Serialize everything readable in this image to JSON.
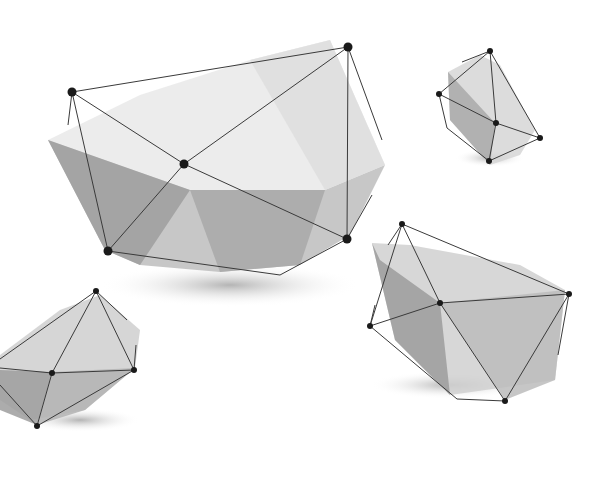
{
  "scene": {
    "width": 615,
    "height": 489,
    "background": "#ffffff",
    "line_color": "#3a3a3a",
    "node_color": "#1a1a1a",
    "shapes": [
      {
        "name": "large-polyhedron",
        "shadow": {
          "cx": 230,
          "cy": 285,
          "rx": 130,
          "ry": 22
        },
        "faces": [
          {
            "points": "48,140 140,95 250,60 330,40 385,165 325,190 190,190",
            "fill": "#e9e9e9"
          },
          {
            "points": "48,140 190,190 325,190 385,165 350,235 300,265 220,272 140,265 105,250",
            "fill": "#bdbdbd"
          },
          {
            "points": "190,190 325,190 300,265 220,272",
            "fill": "#a8a8a8"
          },
          {
            "points": "48,140 105,250 140,265 190,190",
            "fill": "#9d9d9d"
          },
          {
            "points": "250,60 330,40 385,165 325,190",
            "fill": "#dedede"
          }
        ],
        "nodes": [
          [
            72,
            92
          ],
          [
            348,
            47
          ],
          [
            184,
            164
          ],
          [
            108,
            251
          ],
          [
            347,
            239
          ]
        ],
        "edges": [
          [
            72,
            92,
            348,
            47
          ],
          [
            72,
            92,
            184,
            164
          ],
          [
            184,
            164,
            347,
            239
          ],
          [
            348,
            47,
            184,
            164
          ],
          [
            184,
            164,
            108,
            251
          ],
          [
            72,
            92,
            108,
            251
          ],
          [
            348,
            47,
            347,
            239
          ],
          [
            108,
            251,
            280,
            275
          ],
          [
            280,
            275,
            347,
            239
          ],
          [
            348,
            47,
            382,
            140
          ],
          [
            72,
            92,
            68,
            125
          ],
          [
            347,
            239,
            372,
            195
          ]
        ]
      },
      {
        "name": "top-right-polyhedron",
        "shadow": {
          "cx": 490,
          "cy": 158,
          "rx": 35,
          "ry": 9
        },
        "faces": [
          {
            "points": "448,72 480,55 500,65 535,130 520,155 490,165 450,120",
            "fill": "#d6d6d6"
          },
          {
            "points": "448,72 450,120 490,165 495,123",
            "fill": "#a9a9a9"
          }
        ],
        "nodes": [
          [
            490,
            51
          ],
          [
            439,
            94
          ],
          [
            496,
            123
          ],
          [
            540,
            138
          ],
          [
            489,
            161
          ]
        ],
        "edges": [
          [
            490,
            51,
            439,
            94
          ],
          [
            490,
            51,
            496,
            123
          ],
          [
            490,
            51,
            540,
            138
          ],
          [
            439,
            94,
            496,
            123
          ],
          [
            496,
            123,
            540,
            138
          ],
          [
            496,
            123,
            489,
            161
          ],
          [
            540,
            138,
            489,
            161
          ],
          [
            439,
            94,
            447,
            128
          ],
          [
            447,
            128,
            489,
            161
          ],
          [
            490,
            51,
            462,
            62
          ]
        ]
      },
      {
        "name": "bottom-right-polyhedron",
        "shadow": {
          "cx": 450,
          "cy": 385,
          "rx": 80,
          "ry": 14
        },
        "faces": [
          {
            "points": "372,243 410,245 520,265 565,290 555,380 450,395 395,340",
            "fill": "#d0d0d0"
          },
          {
            "points": "372,243 395,340 450,395 440,303 380,260",
            "fill": "#9c9c9c"
          },
          {
            "points": "440,303 565,290 555,380 505,400",
            "fill": "#bcbcbc"
          }
        ],
        "nodes": [
          [
            402,
            224
          ],
          [
            370,
            326
          ],
          [
            440,
            303
          ],
          [
            569,
            294
          ],
          [
            505,
            401
          ]
        ],
        "edges": [
          [
            402,
            224,
            370,
            326
          ],
          [
            402,
            224,
            440,
            303
          ],
          [
            402,
            224,
            569,
            294
          ],
          [
            370,
            326,
            440,
            303
          ],
          [
            440,
            303,
            569,
            294
          ],
          [
            440,
            303,
            505,
            401
          ],
          [
            569,
            294,
            505,
            401
          ],
          [
            370,
            326,
            457,
            399
          ],
          [
            457,
            399,
            505,
            401
          ],
          [
            569,
            294,
            558,
            355
          ],
          [
            402,
            224,
            388,
            245
          ],
          [
            370,
            326,
            375,
            305
          ]
        ]
      },
      {
        "name": "bottom-left-polyhedron",
        "shadow": {
          "cx": 80,
          "cy": 420,
          "rx": 60,
          "ry": 12
        },
        "faces": [
          {
            "points": "0,355 60,310 100,295 140,330 135,368 85,410 30,420 0,400",
            "fill": "#cfcfcf"
          },
          {
            "points": "0,370 52,372 37,425 0,410",
            "fill": "#9e9e9e"
          },
          {
            "points": "52,372 135,368 85,410 37,425",
            "fill": "#b3b3b3"
          }
        ],
        "nodes": [
          [
            96,
            291
          ],
          [
            52,
            373
          ],
          [
            134,
            370
          ],
          [
            37,
            426
          ]
        ],
        "edges": [
          [
            96,
            291,
            0,
            359
          ],
          [
            96,
            291,
            52,
            373
          ],
          [
            96,
            291,
            134,
            370
          ],
          [
            96,
            291,
            127,
            320
          ],
          [
            0,
            368,
            52,
            373
          ],
          [
            52,
            373,
            134,
            370
          ],
          [
            52,
            373,
            37,
            426
          ],
          [
            134,
            370,
            37,
            426
          ],
          [
            0,
            385,
            37,
            426
          ],
          [
            134,
            370,
            136,
            345
          ]
        ]
      }
    ]
  }
}
